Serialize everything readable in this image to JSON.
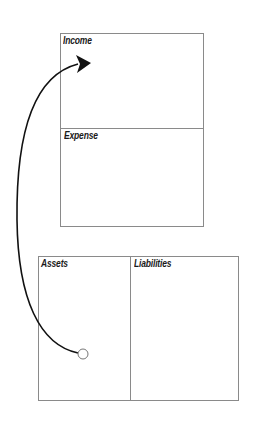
{
  "diagram": {
    "top_statement": {
      "sections": [
        {
          "label": "Income"
        },
        {
          "label": "Expense"
        }
      ]
    },
    "bottom_statement": {
      "sections": [
        {
          "label": "Assets"
        },
        {
          "label": "Liabilities"
        }
      ]
    },
    "arrow": {
      "from": "Assets",
      "to": "Income",
      "colors": {
        "stroke": "#111111",
        "start_marker_fill": "#ffffff"
      }
    }
  }
}
